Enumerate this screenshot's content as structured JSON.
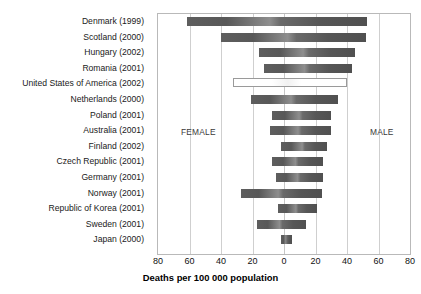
{
  "chart_data": {
    "type": "bar",
    "orientation": "horizontal",
    "subtype": "diverging-population-pyramid",
    "title": "",
    "xlabel": "Deaths per 100 000 population",
    "ylabel": "",
    "xticks": [
      80,
      60,
      40,
      20,
      0,
      20,
      40,
      60,
      80
    ],
    "xlim": [
      -80,
      80
    ],
    "grid": true,
    "legend_position": "in-plot",
    "annotations": [
      {
        "text": "FEMALE",
        "side": "left"
      },
      {
        "text": "MALE",
        "side": "right"
      }
    ],
    "categories": [
      "Denmark (1999)",
      "Scotland (2000)",
      "Hungary (2002)",
      "Romania (2001)",
      "United States of America (2002)",
      "Netherlands (2000)",
      "Poland (2001)",
      "Australia (2001)",
      "Finland (2002)",
      "Czech Republic (2001)",
      "Germany (2001)",
      "Norway (2001)",
      "Republic of Korea (2001)",
      "Sweden (2001)",
      "Japan (2000)"
    ],
    "series": [
      {
        "name": "FEMALE",
        "values": [
          61.5,
          40,
          16,
          12.5,
          32.5,
          21,
          7.5,
          9,
          2,
          7.5,
          5,
          27,
          4,
          17,
          2
        ]
      },
      {
        "name": "MALE",
        "values": [
          53,
          52,
          45,
          43,
          40,
          34,
          30,
          30,
          27,
          25,
          25,
          24,
          21,
          14,
          5
        ]
      }
    ],
    "highlighted_category": "United States of America (2002)"
  },
  "axis": {
    "title": "Deaths per 100 000 population",
    "tick_labels": [
      "80",
      "60",
      "40",
      "20",
      "0",
      "20",
      "40",
      "60",
      "80"
    ]
  },
  "labels": {
    "female": "FEMALE",
    "male": "MALE"
  },
  "colors": {
    "bar_dark": "#565656",
    "bar_light": "#8e8e8e",
    "grid": "#cfcfcf",
    "frame": "#b9b9b9",
    "highlight_fill": "#ffffff",
    "highlight_border": "#9a9a9a",
    "text": "#1a1a1a",
    "background": "#ffffff"
  }
}
